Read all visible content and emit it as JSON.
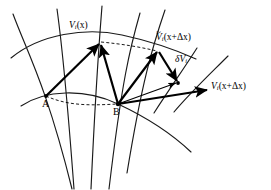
{
  "figure": {
    "background_color": "#ffffff",
    "ink_color": "#000000",
    "width": 271,
    "height": 190
  },
  "labels": {
    "vector_at_x": {
      "symbol": "V",
      "subscript": "i",
      "argument": "(x)",
      "text": "Vᵢ(x)"
    },
    "transported_vector": {
      "symbol": "V",
      "accent": "~",
      "subscript": "i",
      "argument": "(x+Δx)",
      "text": "Ṽᵢ(x+Δx)"
    },
    "variation": {
      "symbol": "δV",
      "subscript": "i",
      "text": "δVᵢ"
    },
    "vector_at_x_plus_dx": {
      "symbol": "V",
      "subscript": "i",
      "argument": "(x+Δx)",
      "text": "Vᵢ(x+Δx)"
    },
    "point_a": "A",
    "point_b": "B"
  },
  "glyphs": {
    "V": "V",
    "delta_cap": "Δ",
    "delta_small": "δ",
    "tilde": "~",
    "sub_i": "i",
    "open_paren": "(",
    "close_paren": ")",
    "plus": "+",
    "x": "x"
  },
  "geometry": {
    "point_a": {
      "x": 46,
      "y": 96
    },
    "point_b": {
      "x": 118,
      "y": 104
    },
    "tip_vector_at_x": {
      "x": 101,
      "y": 42
    },
    "tip_transported_vector": {
      "x": 159,
      "y": 50
    },
    "junction_variation": {
      "x": 178,
      "y": 83
    },
    "tip_vector_at_x_plus_dx": {
      "x": 209,
      "y": 90
    }
  }
}
